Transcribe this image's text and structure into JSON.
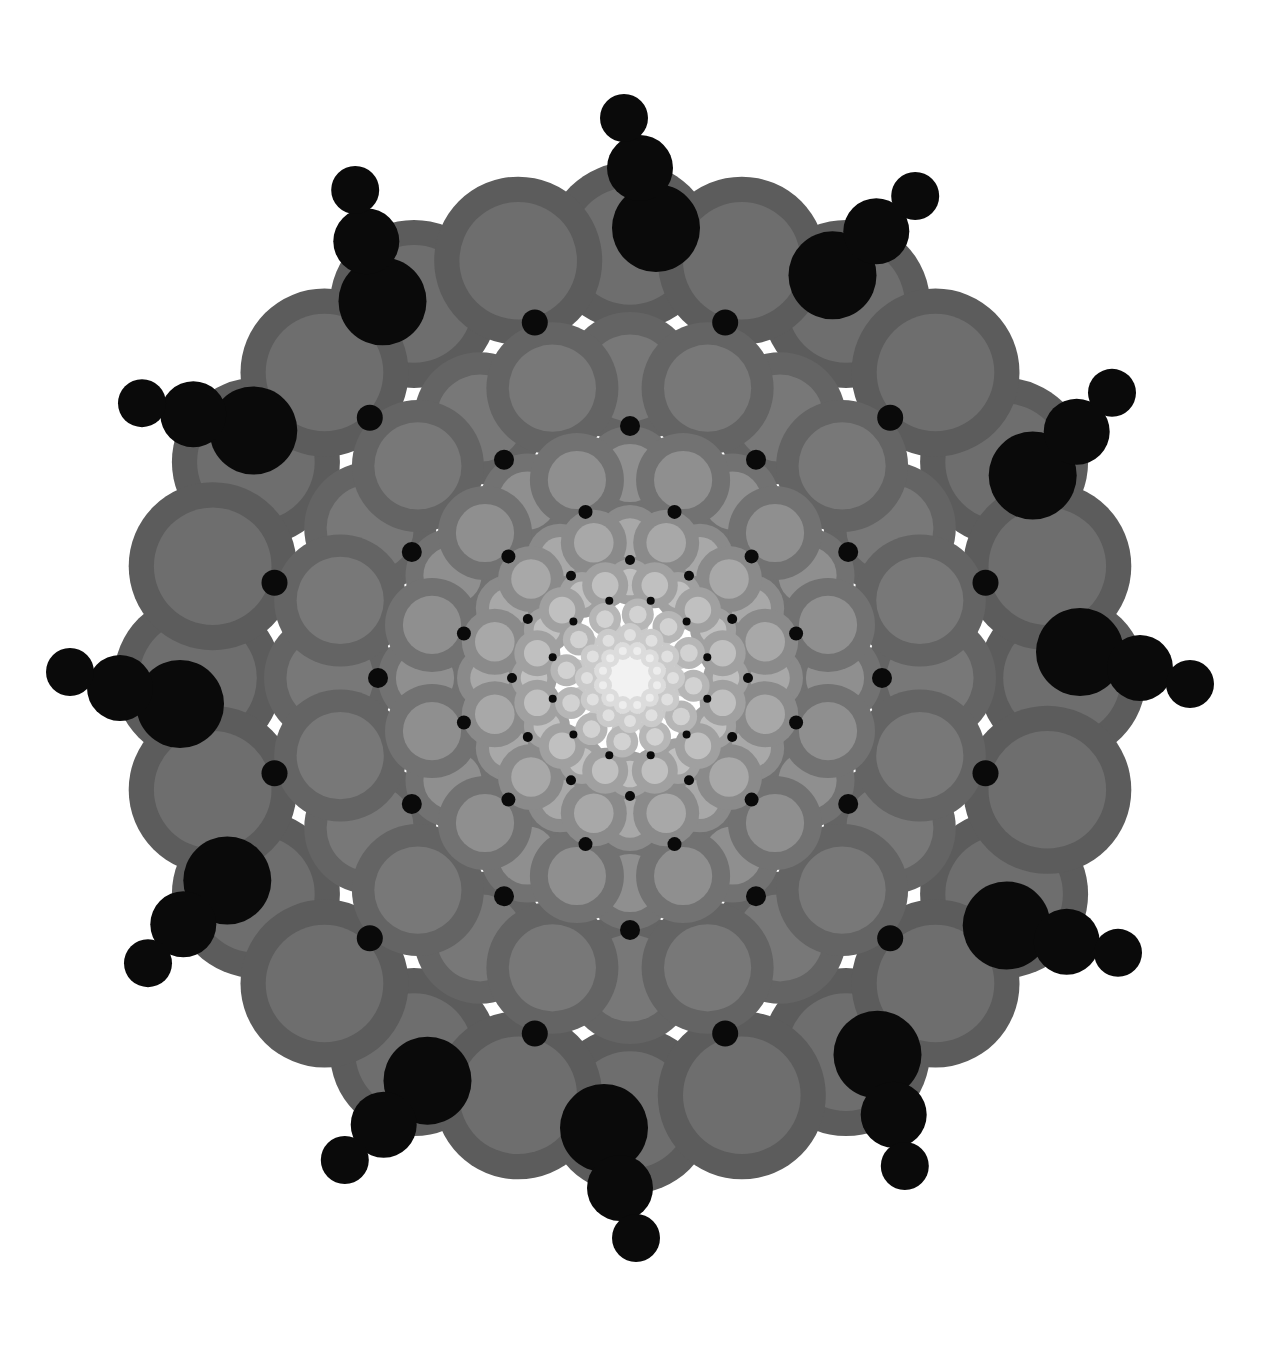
{
  "canvas": {
    "width": 1263,
    "height": 1355,
    "background": "#ffffff",
    "center_x": 630,
    "center_y": 678,
    "title": "Radial Circle Mandala"
  },
  "palette": {
    "background": "#ffffff",
    "node_outer_darkest": "#5c5c5c",
    "node_inner_darkest": "#6e6e6e",
    "node_outer_lightest": "#d8d8d8",
    "node_inner_lightest": "#ececec",
    "accent_black": "#0a0a0a",
    "web_line": "#c9c9c9",
    "core_glow": "#f0f0f0"
  },
  "chart_data": {
    "type": "scatter",
    "xlabel": "",
    "ylabel": "",
    "symmetry_order": 12,
    "ring_count": 7,
    "grid": false,
    "legend": null,
    "center": [
      630,
      678
    ],
    "rings": [
      {
        "index": 0,
        "name": "ring-outer-1",
        "radius": 432,
        "node_count": 12,
        "node_radius": 84,
        "inner_ratio": 0.7,
        "angle_offset": 0,
        "outer_color": "#5c5c5c",
        "inner_color": "#6e6e6e",
        "opacity": 1
      },
      {
        "index": 1,
        "name": "ring-outer-2",
        "radius": 432,
        "node_count": 12,
        "node_radius": 84,
        "inner_ratio": 0.7,
        "angle_offset": 15,
        "outer_color": "#5c5c5c",
        "inner_color": "#6e6e6e",
        "opacity": 1
      },
      {
        "index": 2,
        "name": "ring-3",
        "radius": 300,
        "node_count": 12,
        "node_radius": 66,
        "inner_ratio": 0.66,
        "angle_offset": 0,
        "outer_color": "#646464",
        "inner_color": "#787878",
        "opacity": 1
      },
      {
        "index": 3,
        "name": "ring-4",
        "radius": 300,
        "node_count": 12,
        "node_radius": 66,
        "inner_ratio": 0.66,
        "angle_offset": 15,
        "outer_color": "#646464",
        "inner_color": "#787878",
        "opacity": 1
      },
      {
        "index": 4,
        "name": "ring-5",
        "radius": 205,
        "node_count": 12,
        "node_radius": 47,
        "inner_ratio": 0.62,
        "angle_offset": 0,
        "outer_color": "#727272",
        "inner_color": "#8f8f8f",
        "opacity": 1
      },
      {
        "index": 5,
        "name": "ring-6",
        "radius": 205,
        "node_count": 12,
        "node_radius": 47,
        "inner_ratio": 0.62,
        "angle_offset": 15,
        "outer_color": "#727272",
        "inner_color": "#8f8f8f",
        "opacity": 1
      },
      {
        "index": 6,
        "name": "ring-7",
        "radius": 140,
        "node_count": 12,
        "node_radius": 33,
        "inner_ratio": 0.6,
        "angle_offset": 0,
        "outer_color": "#8a8a8a",
        "inner_color": "#a8a8a8",
        "opacity": 1
      },
      {
        "index": 7,
        "name": "ring-8",
        "radius": 140,
        "node_count": 12,
        "node_radius": 33,
        "inner_ratio": 0.6,
        "angle_offset": 15,
        "outer_color": "#8a8a8a",
        "inner_color": "#a8a8a8",
        "opacity": 1
      },
      {
        "index": 8,
        "name": "ring-9",
        "radius": 96,
        "node_count": 12,
        "node_radius": 23,
        "inner_ratio": 0.58,
        "angle_offset": 0,
        "outer_color": "#a0a0a0",
        "inner_color": "#c0c0c0",
        "opacity": 1
      },
      {
        "index": 9,
        "name": "ring-10",
        "radius": 96,
        "node_count": 12,
        "node_radius": 23,
        "inner_ratio": 0.58,
        "angle_offset": 15,
        "outer_color": "#a0a0a0",
        "inner_color": "#c0c0c0",
        "opacity": 1
      },
      {
        "index": 10,
        "name": "ring-11",
        "radius": 64,
        "node_count": 12,
        "node_radius": 16,
        "inner_ratio": 0.55,
        "angle_offset": 7,
        "outer_color": "#b6b6b6",
        "inner_color": "#d2d2d2",
        "opacity": 1
      },
      {
        "index": 11,
        "name": "ring-12",
        "radius": 43,
        "node_count": 12,
        "node_radius": 12,
        "inner_ratio": 0.5,
        "angle_offset": 0,
        "outer_color": "#cacaca",
        "inner_color": "#e0e0e0",
        "opacity": 1
      },
      {
        "index": 12,
        "name": "ring-13",
        "radius": 28,
        "node_count": 12,
        "node_radius": 9,
        "inner_ratio": 0.45,
        "angle_offset": 15,
        "outer_color": "#dcdcdc",
        "inner_color": "#ededed",
        "opacity": 1
      }
    ],
    "web": {
      "name": "connector-web",
      "stroke": "#c9c9c9",
      "stroke_width": 9,
      "polygon_radius": 432,
      "vertex_count": 12,
      "spoke_inner_radius": 40,
      "spoke_outer_radius": 432,
      "spoke_count": 24
    },
    "black_clusters": {
      "name": "black-cluster-set",
      "color": "#0a0a0a",
      "count": 12,
      "anchor_radius": 432,
      "bead_offsets": [
        18,
        78,
        128
      ],
      "bead_radii": [
        44,
        33,
        24
      ],
      "tangent_jitter": [
        26,
        10,
        -6
      ]
    },
    "black_dots": [
      {
        "name": "dot-ring-a",
        "orbit_radius": 368,
        "count": 12,
        "dot_radius": 13,
        "angle_offset": 15
      },
      {
        "name": "dot-ring-b",
        "orbit_radius": 252,
        "count": 12,
        "dot_radius": 10,
        "angle_offset": 0
      },
      {
        "name": "dot-ring-c",
        "orbit_radius": 172,
        "count": 12,
        "dot_radius": 7,
        "angle_offset": 15
      },
      {
        "name": "dot-ring-d",
        "orbit_radius": 118,
        "count": 12,
        "dot_radius": 5,
        "angle_offset": 0
      },
      {
        "name": "dot-ring-e",
        "orbit_radius": 80,
        "count": 12,
        "dot_radius": 4,
        "angle_offset": 15
      }
    ],
    "core": {
      "name": "core-glow",
      "radius": 46,
      "color": "#f2f2f2"
    }
  }
}
